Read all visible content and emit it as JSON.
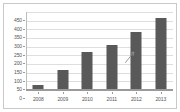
{
  "chart_data": {
    "type": "bar",
    "title": "",
    "subtitle": "",
    "xlabel": "",
    "ylabel": "",
    "categories": [
      "2008",
      "2009",
      "2010",
      "2011",
      "2012",
      "2013"
    ],
    "values": [
      25,
      110,
      215,
      255,
      330,
      410
    ],
    "series": [
      {
        "name": "",
        "values": [
          25,
          110,
          215,
          255,
          330,
          410
        ]
      }
    ],
    "ylim": [
      0,
      450
    ],
    "ytick_labels": [
      "0",
      "50",
      "100",
      "150",
      "200",
      "250",
      "300",
      "350",
      "400",
      "450"
    ],
    "ytick_values": [
      0,
      50,
      100,
      150,
      200,
      250,
      300,
      350,
      400,
      450
    ],
    "xtick_labels": [
      "2008",
      "2009",
      "2010",
      "2011",
      "2012",
      "2013"
    ],
    "grid": true,
    "legend": false,
    "legend_position": "none",
    "bar_color": "#595959",
    "gridline_color": "#dedede",
    "axis_color": "#9a9a9a",
    "border_color": "#c9c9c9",
    "tick_label_color": "#555555",
    "background_color": "#ffffff",
    "annotations": [
      {
        "name": "pen-mark",
        "text": "",
        "near_category": "2012",
        "color": "#8e8e8e"
      }
    ]
  }
}
